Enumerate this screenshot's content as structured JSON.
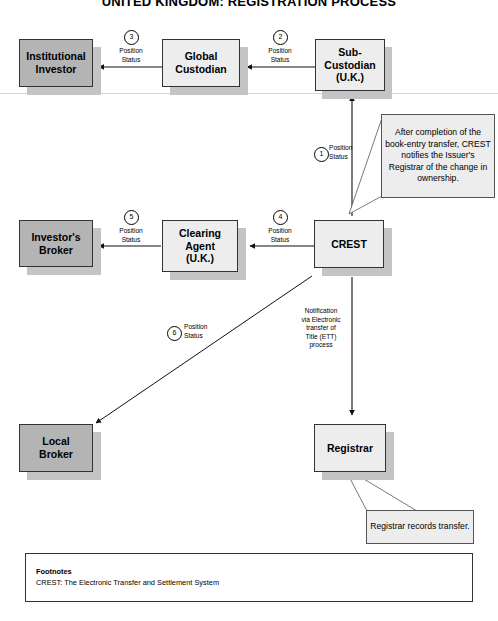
{
  "title": "UNITED KINGDOM: REGISTRATION PROCESS",
  "nodes": {
    "institutional_investor": "Institutional\nInvestor",
    "global_custodian": "Global\nCustodian",
    "sub_custodian": "Sub-\nCustodian\n(U.K.)",
    "investors_broker": "Investor's\nBroker",
    "clearing_agent": "Clearing\nAgent\n(U.K.)",
    "crest": "CREST",
    "local_broker": "Local\nBroker",
    "registrar": "Registrar"
  },
  "callouts": {
    "crest_note": "After completion of the book-entry transfer, CREST notifies the Issuer's Registrar of the change in ownership.",
    "registrar_note": "Registrar records transfer."
  },
  "edges": {
    "e1": {
      "num": "1",
      "label": "Position\nStatus"
    },
    "e2": {
      "num": "2",
      "label": "Position\nStatus"
    },
    "e3": {
      "num": "3",
      "label": "Position\nStatus"
    },
    "e4": {
      "num": "4",
      "label": "Position\nStatus"
    },
    "e5": {
      "num": "5",
      "label": "Position\nStatus"
    },
    "e6": {
      "num": "6",
      "label": "Position\nStatus"
    },
    "ett": {
      "label": "Notification\nvia Electronic\ntransfer of\nTitle (ETT)\nprocess"
    }
  },
  "footnotes": {
    "heading": "Footnotes",
    "line1": "CREST:  The Electronic Transfer and Settlement System"
  },
  "colors": {
    "node_light": "#ededed",
    "node_gray": "#b4b4b4",
    "shadow": "#c4c4c4",
    "border": "#333333",
    "text": "#000000"
  }
}
